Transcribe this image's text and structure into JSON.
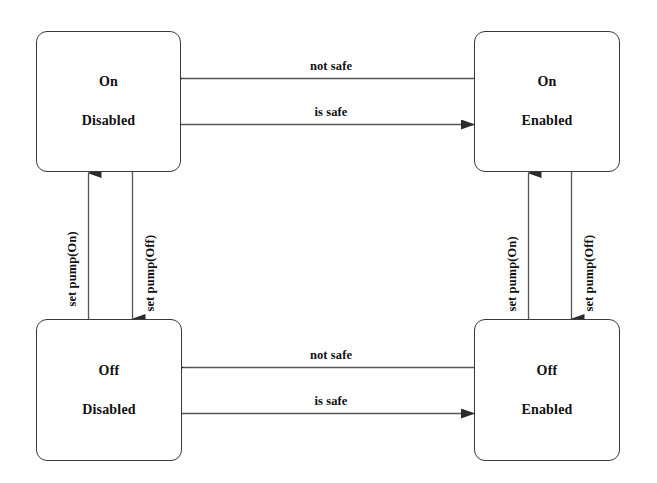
{
  "diagram": {
    "background_color": "#ffffff",
    "stroke_color": "#3a3a3a",
    "text_color": "#111111"
  },
  "states": [
    {
      "id": "on-disabled",
      "primary": "On",
      "secondary": "Disabled"
    },
    {
      "id": "on-enabled",
      "primary": "On",
      "secondary": "Enabled"
    },
    {
      "id": "off-disabled",
      "primary": "Off",
      "secondary": "Disabled"
    },
    {
      "id": "off-enabled",
      "primary": "Off",
      "secondary": "Enabled"
    }
  ],
  "transitions": [
    {
      "id": "top-not-safe",
      "label": "not safe",
      "from": "on-enabled",
      "to": "on-disabled",
      "direction": "left"
    },
    {
      "id": "top-is-safe",
      "label": "is safe",
      "from": "on-disabled",
      "to": "on-enabled",
      "direction": "right"
    },
    {
      "id": "left-set-pump-on",
      "label": "set pump(On)",
      "from": "off-disabled",
      "to": "on-disabled",
      "direction": "up"
    },
    {
      "id": "left-set-pump-off",
      "label": "set pump(Off)",
      "from": "on-disabled",
      "to": "off-disabled",
      "direction": "down"
    },
    {
      "id": "right-set-pump-on",
      "label": "set pump(On)",
      "from": "off-enabled",
      "to": "on-enabled",
      "direction": "up"
    },
    {
      "id": "right-set-pump-off",
      "label": "set pump(Off)",
      "from": "on-enabled",
      "to": "off-enabled",
      "direction": "down"
    },
    {
      "id": "bottom-not-safe",
      "label": "not safe",
      "from": "off-enabled",
      "to": "off-disabled",
      "direction": "left"
    },
    {
      "id": "bottom-is-safe",
      "label": "is safe",
      "from": "off-disabled",
      "to": "off-enabled",
      "direction": "right"
    }
  ]
}
